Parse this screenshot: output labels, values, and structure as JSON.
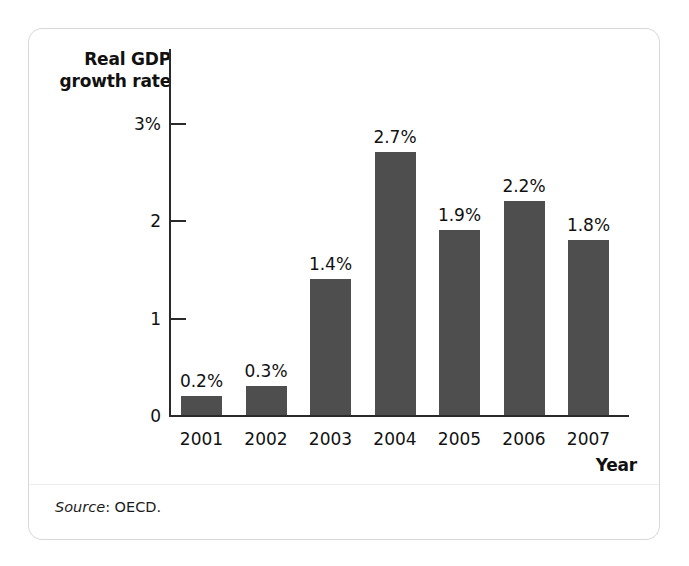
{
  "figure": {
    "y_axis_title_line1": "Real GDP",
    "y_axis_title_line2": "growth rate",
    "x_axis_title": "Year",
    "source_label": "Source",
    "source_text": ": OECD.",
    "bar_color": "#4e4e4e",
    "axis_color": "#2a2a2a",
    "frame_border_color": "#d8d8d8"
  },
  "chart_data": {
    "type": "bar",
    "title": "Real GDP growth rate",
    "xlabel": "Year",
    "ylabel": "Real GDP growth rate",
    "categories": [
      "2001",
      "2002",
      "2003",
      "2004",
      "2005",
      "2006",
      "2007"
    ],
    "values": [
      0.2,
      0.3,
      1.4,
      2.7,
      1.9,
      2.2,
      1.8
    ],
    "value_labels": [
      "0.2%",
      "0.3%",
      "1.4%",
      "2.7%",
      "1.9%",
      "2.2%",
      "1.8%"
    ],
    "ylim": [
      0,
      3.2
    ],
    "ytick_values": [
      0,
      1,
      2,
      3
    ],
    "ytick_labels": [
      "0",
      "1",
      "2",
      "3%"
    ],
    "grid": false,
    "legend": false,
    "series": [
      {
        "name": "Real GDP growth rate",
        "values": [
          0.2,
          0.3,
          1.4,
          2.7,
          1.9,
          2.2,
          1.8
        ]
      }
    ],
    "annotations": [
      "Source: OECD."
    ]
  }
}
